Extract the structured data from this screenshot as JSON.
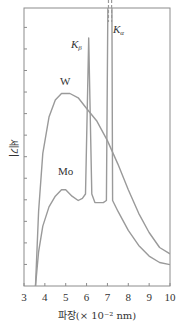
{
  "chart_data": {
    "type": "line",
    "title": "",
    "xlabel": "파장(× 10⁻² nm)",
    "ylabel": "세기",
    "xlim": [
      3,
      10
    ],
    "ylim": [
      0,
      13
    ],
    "x_ticks": [
      3,
      4,
      5,
      6,
      7,
      8,
      9,
      10
    ],
    "y_ticks_count": 12,
    "y_tick_labels_shown": false,
    "grid": false,
    "legend": "inline labels",
    "series": [
      {
        "name": "W",
        "label_pos": [
          5.0,
          9.4
        ],
        "points": [
          [
            3.55,
            0
          ],
          [
            3.7,
            3.5
          ],
          [
            3.9,
            6.2
          ],
          [
            4.2,
            7.9
          ],
          [
            4.5,
            8.7
          ],
          [
            4.8,
            9.0
          ],
          [
            5.2,
            9.0
          ],
          [
            5.6,
            8.8
          ],
          [
            6.0,
            8.3
          ],
          [
            6.5,
            7.7
          ],
          [
            7.0,
            6.8
          ],
          [
            7.5,
            5.7
          ],
          [
            8.0,
            4.5
          ],
          [
            8.5,
            3.4
          ],
          [
            9.0,
            2.5
          ],
          [
            9.5,
            1.8
          ],
          [
            10.0,
            1.5
          ]
        ]
      },
      {
        "name": "Mo",
        "label_pos": [
          4.7,
          5.0
        ],
        "points": [
          [
            3.55,
            0
          ],
          [
            3.7,
            1.6
          ],
          [
            3.9,
            2.8
          ],
          [
            4.2,
            3.7
          ],
          [
            4.5,
            4.2
          ],
          [
            4.8,
            4.5
          ],
          [
            5.0,
            4.5
          ],
          [
            5.3,
            4.2
          ],
          [
            5.6,
            4.0
          ],
          [
            5.8,
            4.1
          ],
          [
            5.95,
            4.3
          ],
          [
            6.1,
            11.6
          ],
          [
            6.25,
            4.3
          ],
          [
            6.4,
            3.9
          ],
          [
            6.8,
            3.9
          ],
          [
            6.95,
            4.0
          ],
          [
            7.05,
            17.0
          ],
          [
            7.2,
            17.0
          ],
          [
            7.25,
            4.0
          ],
          [
            7.5,
            3.5
          ],
          [
            8.0,
            2.6
          ],
          [
            8.5,
            1.9
          ],
          [
            9.0,
            1.4
          ],
          [
            9.5,
            1.1
          ],
          [
            10.0,
            1.0
          ]
        ]
      }
    ],
    "annotations": [
      {
        "text": "K",
        "sub": "β",
        "x": 5.75,
        "y": 11.4
      },
      {
        "text": "K",
        "sub": "α",
        "x": 7.35,
        "y": 12.4
      }
    ]
  },
  "axes": {
    "x_tick_labels": [
      "3",
      "4",
      "5",
      "6",
      "7",
      "8",
      "9",
      "10"
    ],
    "xlabel": "파장(× 10⁻² nm)",
    "ylabel": "세기"
  },
  "labels": {
    "w": "W",
    "mo": "Mo",
    "k_beta_main": "K",
    "k_beta_sub": "β",
    "k_alpha_main": "K",
    "k_alpha_sub": "α"
  }
}
